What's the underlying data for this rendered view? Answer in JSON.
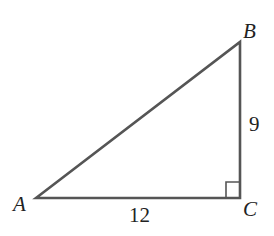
{
  "diagram": {
    "type": "right-triangle",
    "vertices": {
      "A": {
        "label": "A",
        "x": 36,
        "y": 198
      },
      "B": {
        "label": "B",
        "x": 240,
        "y": 42
      },
      "C": {
        "label": "C",
        "x": 240,
        "y": 198
      }
    },
    "sides": {
      "AC": {
        "label": "12"
      },
      "BC": {
        "label": "9"
      }
    },
    "right_angle_at": "C",
    "stroke_color": "#555555"
  }
}
